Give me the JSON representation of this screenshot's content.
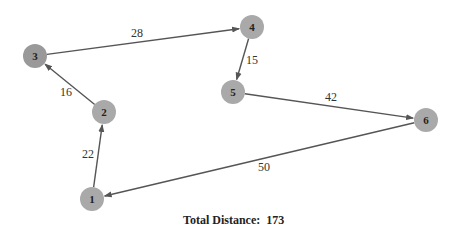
{
  "diagram": {
    "type": "directed-graph",
    "nodes": [
      {
        "id": "1",
        "label": "1",
        "x": 92,
        "y": 199,
        "color": "#a9a9a9"
      },
      {
        "id": "2",
        "label": "2",
        "x": 104,
        "y": 112,
        "color": "#a9a9a9"
      },
      {
        "id": "3",
        "label": "3",
        "x": 35,
        "y": 56,
        "color": "#999999"
      },
      {
        "id": "4",
        "label": "4",
        "x": 252,
        "y": 27,
        "color": "#a9a9a9"
      },
      {
        "id": "5",
        "label": "5",
        "x": 233,
        "y": 92,
        "color": "#a9a9a9"
      },
      {
        "id": "6",
        "label": "6",
        "x": 426,
        "y": 120,
        "color": "#a9a9a9"
      }
    ],
    "edges": [
      {
        "from": "1",
        "to": "2",
        "weight": "22",
        "lx": 88,
        "ly": 158
      },
      {
        "from": "2",
        "to": "3",
        "weight": "16",
        "lx": 66,
        "ly": 96
      },
      {
        "from": "3",
        "to": "4",
        "weight": "28",
        "lx": 137,
        "ly": 37
      },
      {
        "from": "4",
        "to": "5",
        "weight": "15",
        "lx": 252,
        "ly": 64
      },
      {
        "from": "5",
        "to": "6",
        "weight": "42",
        "lx": 331,
        "ly": 101
      },
      {
        "from": "6",
        "to": "1",
        "weight": "50",
        "lx": 264,
        "ly": 171
      }
    ],
    "edge_color": "#555555"
  },
  "footer": {
    "total_label": "Total Distance:",
    "total_value": "173"
  }
}
